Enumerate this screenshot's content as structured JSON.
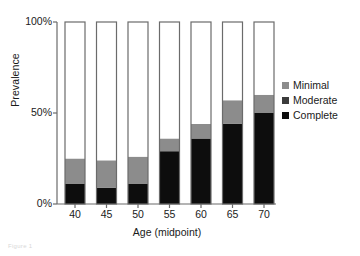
{
  "chart_data": {
    "type": "bar",
    "title": "",
    "subtitle": "",
    "xlabel": "Age (midpoint)",
    "ylabel": "Prevalence",
    "categories": [
      "40",
      "45",
      "50",
      "55",
      "60",
      "65",
      "70"
    ],
    "ylim": [
      0,
      100
    ],
    "ytick_labels": [
      "0%",
      "50%",
      "100%"
    ],
    "ytick_values": [
      0,
      50,
      100
    ],
    "grid": false,
    "stacked": true,
    "legend_position": "right",
    "series": [
      {
        "name": "Complete",
        "color": "#0d0d0d",
        "values": [
          11,
          9,
          11,
          29,
          36,
          44,
          50
        ]
      },
      {
        "name": "Moderate",
        "color": "#3b3b3b",
        "values": [
          0,
          0,
          0,
          0,
          0,
          0,
          0
        ]
      },
      {
        "name": "Minimal",
        "color": "#8c8c8c",
        "values": [
          14,
          15,
          15,
          7,
          8,
          13,
          10
        ]
      },
      {
        "name": "None",
        "color": "#ffffff",
        "values": [
          75,
          76,
          74,
          64,
          56,
          43,
          40
        ]
      }
    ],
    "stack_tops": [
      25,
      24,
      26,
      36,
      44,
      57,
      60
    ],
    "bar_outline_color": "#6b6b6b",
    "axis_color": "#6b6b6b"
  },
  "legend": {
    "items": [
      {
        "label": "Minimal",
        "color": "#8c8c8c"
      },
      {
        "label": "Moderate",
        "color": "#3b3b3b"
      },
      {
        "label": "Complete",
        "color": "#0d0d0d"
      }
    ]
  },
  "caption": {
    "text": "Figure 1"
  }
}
